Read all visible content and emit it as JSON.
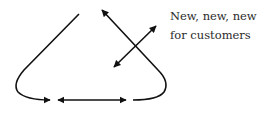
{
  "diagram": {
    "label_line1": "New, new, new",
    "label_line2": "for customers",
    "stroke_color": "#111111",
    "background": "#ffffff"
  }
}
